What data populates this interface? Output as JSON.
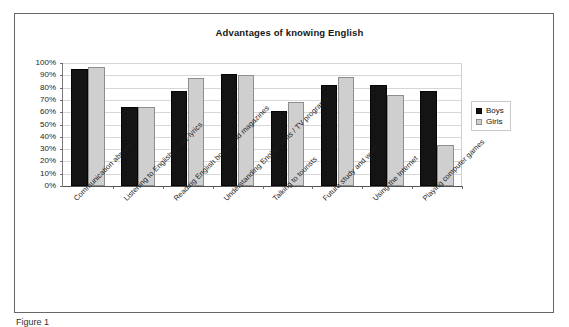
{
  "figure": {
    "caption": "Figure 1"
  },
  "legend": {
    "position": "right",
    "items": [
      {
        "label": "Boys",
        "color": "#141414"
      },
      {
        "label": "Girls",
        "color": "#cfcfcf"
      }
    ]
  },
  "chart_data": {
    "type": "bar",
    "title": "Advantages of knowing English",
    "xlabel": "",
    "ylabel": "",
    "ylim": [
      0,
      100
    ],
    "ytick_labels": [
      "100%",
      "90%",
      "80%",
      "70%",
      "60%",
      "50%",
      "40%",
      "30%",
      "20%",
      "10%",
      "0%"
    ],
    "ytick_values": [
      100,
      90,
      80,
      70,
      60,
      50,
      40,
      30,
      20,
      10,
      0
    ],
    "grid": true,
    "legend_position": "right",
    "categories": [
      "Communication abroad",
      "Listening to English music lyrics",
      "Reading English books and magazines",
      "Understanding English films / TV programs",
      "Talking to tourists",
      "Future study and work",
      "Using the Internet",
      "Playing computer games"
    ],
    "series": [
      {
        "name": "Boys",
        "color": "#141414",
        "values": [
          95,
          64,
          77,
          91,
          61,
          82,
          82,
          77
        ]
      },
      {
        "name": "Girls",
        "color": "#cfcfcf",
        "values": [
          97,
          64,
          88,
          90,
          68,
          89,
          74,
          33
        ]
      }
    ]
  }
}
